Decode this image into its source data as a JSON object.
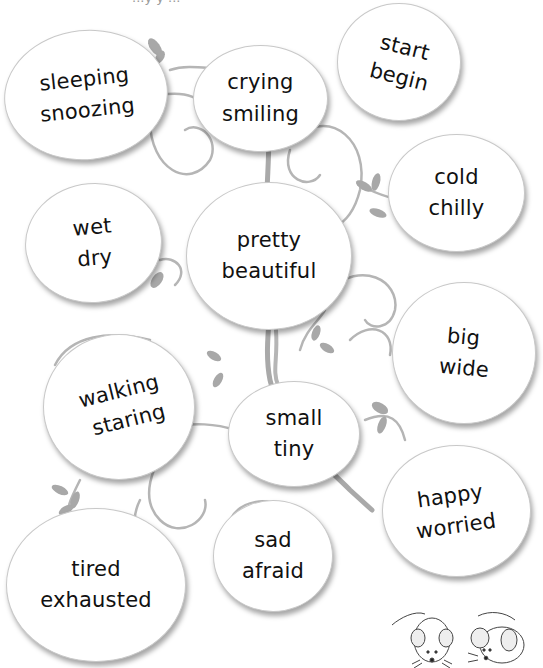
{
  "worksheet": {
    "top_fragment": "...y  y ...",
    "bubbles": [
      {
        "id": "sleeping",
        "words": [
          "sleeping",
          "snoozing"
        ]
      },
      {
        "id": "crying",
        "words": [
          "crying",
          "smiling"
        ]
      },
      {
        "id": "start",
        "words": [
          "start",
          "begin"
        ]
      },
      {
        "id": "cold",
        "words": [
          "cold",
          "chilly"
        ]
      },
      {
        "id": "wet",
        "words": [
          "wet",
          "dry"
        ]
      },
      {
        "id": "pretty",
        "words": [
          "pretty",
          "beautiful"
        ]
      },
      {
        "id": "big",
        "words": [
          "big",
          "wide"
        ]
      },
      {
        "id": "walking",
        "words": [
          "walking",
          "staring"
        ]
      },
      {
        "id": "small",
        "words": [
          "small",
          "tiny"
        ]
      },
      {
        "id": "happy",
        "words": [
          "happy",
          "worried"
        ]
      },
      {
        "id": "tired",
        "words": [
          "tired",
          "exhausted"
        ]
      },
      {
        "id": "sad",
        "words": [
          "sad",
          "afraid"
        ]
      }
    ],
    "decorations": [
      "tree-trunk",
      "curly-vines",
      "leaves",
      "mouse-front",
      "mouse-side"
    ]
  }
}
